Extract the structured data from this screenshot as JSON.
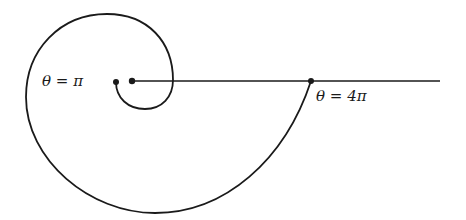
{
  "figure": {
    "type": "spiral-diagram",
    "stroke_color": "#1a1a1a",
    "background": "#ffffff",
    "labels": [
      {
        "id": "theta-pi",
        "text": "θ = π",
        "x": 42,
        "y": 75
      },
      {
        "id": "theta-4pi",
        "text": "θ = 4π",
        "x": 316,
        "y": 89
      }
    ],
    "points": [
      {
        "id": "origin",
        "x": 132,
        "y": 81
      },
      {
        "id": "theta-pi-point",
        "x": 116,
        "y": 82
      },
      {
        "id": "theta-4pi-point",
        "x": 311,
        "y": 81
      }
    ],
    "ray": {
      "x1": 132,
      "y1": 81,
      "x2": 440,
      "y2": 81
    }
  }
}
